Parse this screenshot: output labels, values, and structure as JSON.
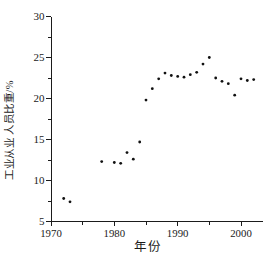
{
  "page": {
    "background": "#ffffff"
  },
  "chart_data": {
    "type": "scatter",
    "title": "",
    "xlabel": "年份",
    "ylabel": "工业从业 人员比重/%",
    "xlim": [
      1970,
      2003.5
    ],
    "ylim": [
      5,
      30
    ],
    "x_major_ticks": [
      1970,
      1980,
      1990,
      2000
    ],
    "x_minor_ticks": [
      1975,
      1985,
      1995
    ],
    "y_major_ticks": [
      5,
      10,
      15,
      20,
      25,
      30
    ],
    "y_minor_ticks": [
      7.5,
      12.5,
      17.5,
      22.5,
      27.5
    ],
    "grid": false,
    "legend": null,
    "axis_color": "#1b1b1b",
    "marker": {
      "shape": "dot",
      "color": "#111111",
      "radius_px": 1.4
    },
    "points": [
      [
        1972,
        7.8
      ],
      [
        1973,
        7.4
      ],
      [
        1978,
        12.3
      ],
      [
        1980,
        12.2
      ],
      [
        1981,
        12.1
      ],
      [
        1982,
        13.4
      ],
      [
        1983,
        12.6
      ],
      [
        1984,
        14.7
      ],
      [
        1985,
        19.8
      ],
      [
        1986,
        21.2
      ],
      [
        1987,
        22.4
      ],
      [
        1988,
        23.1
      ],
      [
        1989,
        22.8
      ],
      [
        1990,
        22.7
      ],
      [
        1991,
        22.6
      ],
      [
        1992,
        22.9
      ],
      [
        1993,
        23.2
      ],
      [
        1994,
        24.2
      ],
      [
        1995,
        25.0
      ],
      [
        1996,
        22.5
      ],
      [
        1997,
        22.1
      ],
      [
        1998,
        21.8
      ],
      [
        1999,
        20.4
      ],
      [
        2000,
        22.4
      ],
      [
        2001,
        22.2
      ],
      [
        2002,
        22.3
      ]
    ]
  }
}
